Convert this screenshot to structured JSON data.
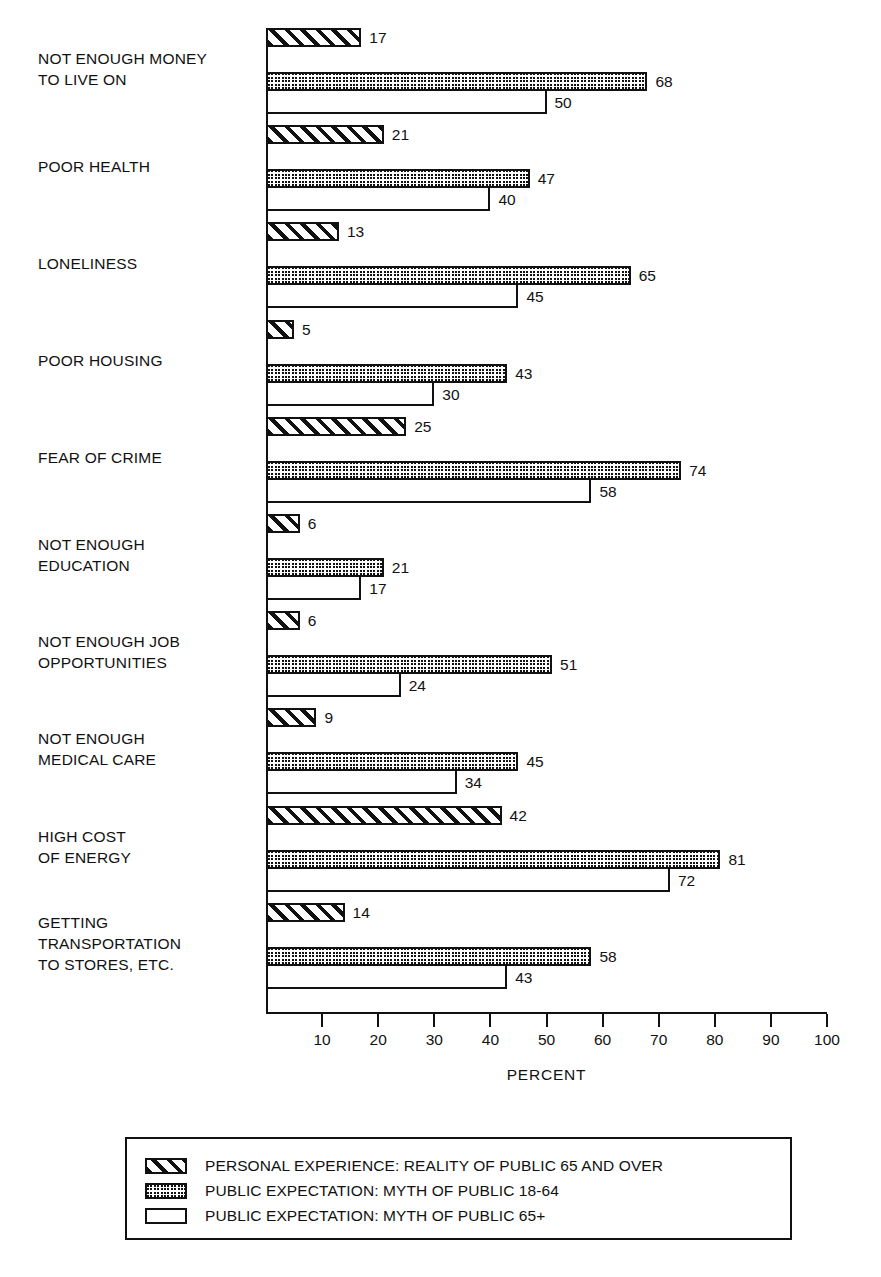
{
  "chart_data": {
    "type": "bar",
    "orientation": "horizontal",
    "title": "",
    "xlabel": "PERCENT",
    "ylabel": "",
    "xlim": [
      0,
      100
    ],
    "xticks": [
      10,
      20,
      30,
      40,
      50,
      60,
      70,
      80,
      90,
      100
    ],
    "grid": false,
    "legend_position": "bottom",
    "categories": [
      "NOT ENOUGH MONEY\nTO LIVE ON",
      "POOR HEALTH",
      "LONELINESS",
      "POOR HOUSING",
      "FEAR OF CRIME",
      "NOT ENOUGH\nEDUCATION",
      "NOT ENOUGH JOB\nOPPORTUNITIES",
      "NOT ENOUGH\nMEDICAL CARE",
      "HIGH COST\nOF ENERGY",
      "GETTING\nTRANSPORTATION\nTO STORES, ETC."
    ],
    "series": [
      {
        "name": "PERSONAL EXPERIENCE: REALITY OF PUBLIC 65 AND OVER",
        "pattern": "diagonal-hatch",
        "values": [
          17,
          21,
          13,
          5,
          25,
          6,
          6,
          9,
          42,
          14
        ]
      },
      {
        "name": "PUBLIC EXPECTATION: MYTH OF PUBLIC 18-64",
        "pattern": "checker-fill",
        "values": [
          68,
          47,
          65,
          43,
          74,
          21,
          51,
          45,
          81,
          58
        ]
      },
      {
        "name": "PUBLIC EXPECTATION: MYTH OF PUBLIC 65+",
        "pattern": "open-outline",
        "values": [
          50,
          40,
          45,
          30,
          58,
          17,
          24,
          34,
          72,
          43
        ]
      }
    ]
  },
  "legend": {
    "items": [
      {
        "label": "PERSONAL EXPERIENCE: REALITY OF PUBLIC 65 AND OVER",
        "swatch": "diagonal-hatch-swatch"
      },
      {
        "label": "PUBLIC EXPECTATION: MYTH OF PUBLIC 18-64",
        "swatch": "checker-fill-swatch"
      },
      {
        "label": "PUBLIC EXPECTATION: MYTH OF PUBLIC 65+",
        "swatch": "open-outline-swatch"
      }
    ]
  },
  "colors": {
    "ink": "#111111",
    "paper": "#ffffff"
  }
}
